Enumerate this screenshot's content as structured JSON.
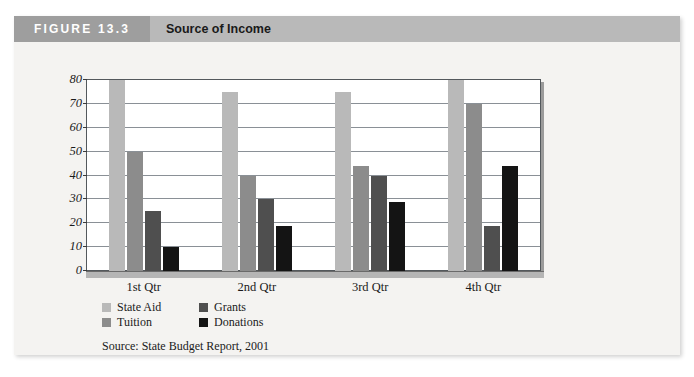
{
  "figure": {
    "number_label": "FIGURE 13.3",
    "title": "Source of Income",
    "source_note": "Source: State Budget Report, 2001"
  },
  "colors": {
    "state_aid": "#b9b9b9",
    "tuition": "#8c8c8c",
    "grants": "#4f4f4f",
    "donations": "#141414",
    "header_band": "#b9b9b9",
    "header_number_band": "#9e9e9e",
    "card_background": "#f4f3f1",
    "plot_background": "#ffffff",
    "gridline": "#8a9096"
  },
  "chart_data": {
    "type": "bar",
    "title": "Source of Income",
    "xlabel": "",
    "ylabel": "",
    "ylim": [
      0,
      80
    ],
    "yticks": [
      0,
      10,
      20,
      30,
      40,
      50,
      60,
      70,
      80
    ],
    "grid": true,
    "legend_position": "bottom-left",
    "categories": [
      "1st Qtr",
      "2nd Qtr",
      "3rd Qtr",
      "4th Qtr"
    ],
    "series": [
      {
        "name": "State Aid",
        "values": [
          80,
          75,
          75,
          80
        ]
      },
      {
        "name": "Tuition",
        "values": [
          50,
          40,
          44,
          70
        ]
      },
      {
        "name": "Grants",
        "values": [
          25,
          30,
          40,
          19
        ]
      },
      {
        "name": "Donations",
        "values": [
          10,
          19,
          29,
          44
        ]
      }
    ]
  },
  "legend": {
    "rows": [
      [
        {
          "label": "State Aid",
          "color": "#b9b9b9"
        },
        {
          "label": "Grants",
          "color": "#4f4f4f"
        }
      ],
      [
        {
          "label": "Tuition",
          "color": "#8c8c8c"
        },
        {
          "label": "Donations",
          "color": "#141414"
        }
      ]
    ]
  }
}
